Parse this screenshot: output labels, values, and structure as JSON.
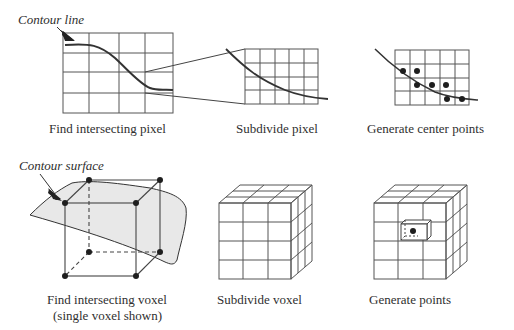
{
  "figure": {
    "top_row": {
      "panels": [
        {
          "id": "find-pixel",
          "caption": "Find intersecting pixel",
          "annotation": "Contour line"
        },
        {
          "id": "subdivide-pixel",
          "caption": "Subdivide pixel"
        },
        {
          "id": "center-points",
          "caption": "Generate center points"
        }
      ]
    },
    "bottom_row": {
      "panels": [
        {
          "id": "find-voxel",
          "caption_line1": "Find intersecting voxel",
          "caption_line2": "(single voxel shown)",
          "annotation": "Contour surface"
        },
        {
          "id": "subdivide-voxel",
          "caption": "Subdivide voxel"
        },
        {
          "id": "generate-points",
          "caption": "Generate points"
        }
      ]
    },
    "colors": {
      "line": "#3a3a3a",
      "grid": "#555555",
      "surface_fill": "#e6e6e6",
      "dot": "#1e1e1e",
      "background": "#ffffff"
    },
    "icons": [
      "arrow-pointer-icon"
    ]
  }
}
